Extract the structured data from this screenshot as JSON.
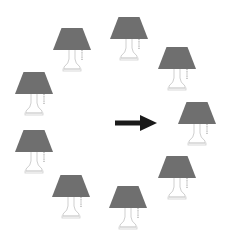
{
  "diagram": {
    "colors": {
      "background": "#ffffff",
      "shade": "#6f6f6f",
      "base_outline": "#cfcfcf",
      "pull_chain": "#a8a8a8",
      "arrow": "#1a1a1a"
    },
    "lamps": [
      {
        "id": "top",
        "cx": 129,
        "top": 17,
        "scale": 1.0
      },
      {
        "id": "upper-left",
        "cx": 72,
        "top": 28,
        "scale": 1.0
      },
      {
        "id": "upper-right",
        "cx": 177,
        "top": 47,
        "scale": 1.0
      },
      {
        "id": "left-upper",
        "cx": 34,
        "top": 72,
        "scale": 1.0
      },
      {
        "id": "right-target",
        "cx": 197,
        "top": 102,
        "scale": 1.0
      },
      {
        "id": "left-lower",
        "cx": 34,
        "top": 130,
        "scale": 1.0
      },
      {
        "id": "lower-right",
        "cx": 177,
        "top": 156,
        "scale": 1.0
      },
      {
        "id": "lower-left",
        "cx": 71,
        "top": 175,
        "scale": 1.0
      },
      {
        "id": "bottom",
        "cx": 128,
        "top": 186,
        "scale": 1.0
      }
    ],
    "arrow": {
      "x1": 115,
      "x2": 157,
      "y": 123,
      "head_len": 17,
      "head_half": 8,
      "shaft_width": 5,
      "points_to": "right-target"
    }
  }
}
